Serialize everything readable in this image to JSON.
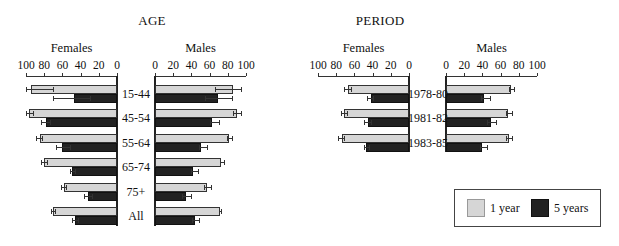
{
  "chart_data": [
    {
      "type": "bar",
      "orientation": "horizontal-butterfly",
      "title": "AGE",
      "categories": [
        "15-44",
        "45-54",
        "55-64",
        "65-74",
        "75+",
        "All"
      ],
      "panels": [
        {
          "name": "Females",
          "direction": "left",
          "xlim": [
            0,
            100
          ],
          "ticks": [
            "100",
            "80",
            "60",
            "40",
            "20",
            "0"
          ],
          "series": [
            {
              "name": "1 year",
              "values": [
                94,
                97,
                85,
                80,
                58,
                70
              ]
            },
            {
              "name": "5 years",
              "values": [
                47,
                78,
                60,
                49,
                32,
                46
              ]
            }
          ]
        },
        {
          "name": "Males",
          "direction": "right",
          "xlim": [
            0,
            100
          ],
          "ticks": [
            "0",
            "20",
            "40",
            "60",
            "80",
            "100"
          ],
          "series": [
            {
              "name": "1 year",
              "values": [
                86,
                90,
                81,
                73,
                57,
                71
              ]
            },
            {
              "name": "5 years",
              "values": [
                69,
                63,
                51,
                42,
                34,
                44
              ]
            }
          ]
        }
      ]
    },
    {
      "type": "bar",
      "orientation": "horizontal-butterfly",
      "title": "PERIOD",
      "categories": [
        "1978-80",
        "1981-82",
        "1983-85"
      ],
      "panels": [
        {
          "name": "Females",
          "direction": "left",
          "xlim": [
            0,
            100
          ],
          "ticks": [
            "100",
            "80",
            "60",
            "40",
            "20",
            "0"
          ],
          "series": [
            {
              "name": "1 year",
              "values": [
                67,
                71,
                74
              ]
            },
            {
              "name": "5 years",
              "values": [
                42,
                45,
                47
              ]
            }
          ]
        },
        {
          "name": "Males",
          "direction": "right",
          "xlim": [
            0,
            100
          ],
          "ticks": [
            "0",
            "20",
            "40",
            "60",
            "80",
            "100"
          ],
          "series": [
            {
              "name": "1 year",
              "values": [
                71,
                68,
                69
              ]
            },
            {
              "name": "5 years",
              "values": [
                42,
                49,
                40
              ]
            }
          ]
        }
      ]
    }
  ],
  "legend": {
    "items": [
      {
        "label": "1 year",
        "color": "#d6d6d6"
      },
      {
        "label": "5 years",
        "color": "#222222"
      }
    ]
  },
  "errors": {
    "age": {
      "female_1y": [
        [
          70,
          100
        ],
        [
          92,
          100
        ],
        [
          82,
          89
        ],
        [
          77,
          83
        ],
        [
          56,
          61
        ],
        [
          68,
          72
        ]
      ],
      "female_5y": [
        [
          30,
          70
        ],
        [
          74,
          83
        ],
        [
          52,
          67
        ],
        [
          46,
          52
        ],
        [
          28,
          36
        ],
        [
          43,
          50
        ]
      ],
      "male_1y": [
        [
          66,
          94
        ],
        [
          86,
          94
        ],
        [
          79,
          85
        ],
        [
          71,
          76
        ],
        [
          54,
          62
        ],
        [
          70,
          73
        ]
      ],
      "male_5y": [
        [
          55,
          85
        ],
        [
          60,
          70
        ],
        [
          48,
          57
        ],
        [
          40,
          47
        ],
        [
          30,
          40
        ],
        [
          41,
          48
        ]
      ]
    },
    "period": {
      "female_1y": [
        [
          64,
          71
        ],
        [
          68,
          75
        ],
        [
          71,
          78
        ]
      ],
      "female_5y": [
        [
          40,
          46
        ],
        [
          42,
          49
        ],
        [
          44,
          50
        ]
      ],
      "male_1y": [
        [
          69,
          75
        ],
        [
          66,
          72
        ],
        [
          66,
          73
        ]
      ],
      "male_5y": [
        [
          39,
          48
        ],
        [
          45,
          55
        ],
        [
          37,
          45
        ]
      ]
    }
  },
  "colors": {
    "one_year": "#d6d6d6",
    "five_years": "#222222",
    "border": "#333333"
  }
}
